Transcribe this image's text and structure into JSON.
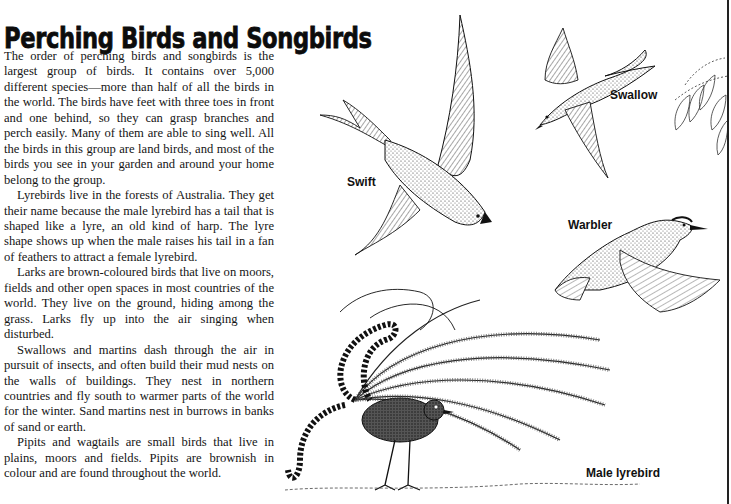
{
  "page": {
    "title": "Perching Birds and Songbirds",
    "paragraphs": [
      "The order of perching birds and songbirds is the largest group of birds. It contains over 5,000 different species—more than half of all the birds in the world. The birds have feet with three toes in front and one behind, so they can grasp branches and perch easily. Many of them are able to sing well. All the birds in this group are land birds, and most of the birds you see in your garden and around your home belong to the group.",
      "Lyrebirds live in the forests of Australia. They get their name because the male lyrebird has a tail that is shaped like a lyre, an old kind of harp. The lyre shape shows up when the male raises his tail in a fan of feathers to attract a female lyrebird.",
      "Larks are brown-coloured birds that live on moors, fields and other open spaces in most countries of the world. They live on the ground, hiding among the grass. Larks fly up into the air singing when disturbed.",
      "Swallows and martins dash through the air in pursuit of insects, and often build their mud nests on the walls of buildings. They nest in northern countries and fly south to warmer parts of the world for the winter. Sand martins nest in burrows in banks of sand or earth.",
      "Pipits and wagtails are small birds that live in plains, moors and fields. Pipits are brownish in colour and are found throughout the world."
    ]
  },
  "illustrations": {
    "swift": {
      "label": "Swift"
    },
    "swallow": {
      "label": "Swallow"
    },
    "warbler": {
      "label": "Warbler"
    },
    "lyrebird": {
      "label": "Male lyrebird"
    }
  },
  "colors": {
    "ink": "#151515",
    "paper": "#ffffff"
  }
}
